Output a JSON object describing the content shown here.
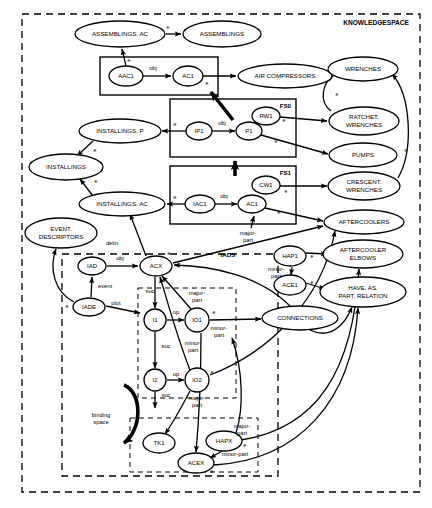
{
  "diagram": {
    "title": "KNOWLEDGESPACE",
    "type": "semantic-network-knowledge-representation",
    "stroke_color": "#000000",
    "background_color": "#ffffff",
    "outer_frame_label": "KNOWLEDGESPACE",
    "regions": [
      {
        "id": "knowledgespace",
        "label": "KNOWLEDGESPACE",
        "style": "dashed",
        "x": 22,
        "y": 14,
        "w": 398,
        "h": 478
      },
      {
        "id": "iads",
        "label": "IADS",
        "style": "dashed",
        "x": 62,
        "y": 254,
        "w": 216,
        "h": 222
      },
      {
        "id": "inner-iads-ops",
        "label": "",
        "style": "dashed",
        "x": 138,
        "y": 288,
        "w": 98,
        "h": 110
      },
      {
        "id": "inner-iads-objs",
        "label": "",
        "style": "dashed",
        "x": 130,
        "y": 418,
        "w": 128,
        "h": 54
      },
      {
        "id": "fs0",
        "label": "FS0",
        "style": "solid",
        "x": 100,
        "y": 57,
        "w": 118,
        "h": 38
      },
      {
        "id": "fs1",
        "label": "FS1",
        "style": "solid",
        "x": 170,
        "y": 99,
        "w": 126,
        "h": 58
      },
      {
        "id": "fs2",
        "label": "FS2",
        "style": "solid",
        "x": 170,
        "y": 166,
        "w": 126,
        "h": 58
      }
    ],
    "nodes": [
      {
        "id": "assemblings_ac",
        "label": "ASSEMBLINGS. AC",
        "shape": "ellipse",
        "cx": 120,
        "cy": 34,
        "rx": 45,
        "ry": 13,
        "font": 6.2
      },
      {
        "id": "assemblings",
        "label": "ASSEMBLINGS",
        "shape": "ellipse",
        "cx": 222,
        "cy": 34,
        "rx": 39,
        "ry": 13,
        "font": 6.2
      },
      {
        "id": "aac1",
        "label": "AAC1",
        "shape": "ellipse",
        "cx": 126,
        "cy": 76,
        "rx": 17,
        "ry": 10,
        "font": 6.0
      },
      {
        "id": "ac1_fs0",
        "label": "AC1",
        "shape": "ellipse",
        "cx": 188,
        "cy": 76,
        "rx": 15,
        "ry": 10,
        "font": 6.0
      },
      {
        "id": "air_compressors",
        "label": "AIR COMPRESSORS",
        "shape": "ellipse",
        "cx": 285,
        "cy": 76,
        "rx": 47,
        "ry": 12,
        "font": 6.2
      },
      {
        "id": "installings_p",
        "label": "INSTALLINGS. P",
        "shape": "ellipse",
        "cx": 120,
        "cy": 131,
        "rx": 41,
        "ry": 12,
        "font": 6.2
      },
      {
        "id": "ip1",
        "label": "IP1",
        "shape": "ellipse",
        "cx": 199,
        "cy": 131,
        "rx": 13,
        "ry": 9,
        "font": 6.0
      },
      {
        "id": "p1",
        "label": "P1",
        "shape": "ellipse",
        "cx": 249,
        "cy": 131,
        "rx": 13,
        "ry": 9,
        "font": 6.0
      },
      {
        "id": "rw1",
        "label": "RW1",
        "shape": "ellipse",
        "cx": 266,
        "cy": 116,
        "rx": 14,
        "ry": 9,
        "font": 6.0
      },
      {
        "id": "installings",
        "label": "INSTALLINGS",
        "shape": "ellipse",
        "cx": 66,
        "cy": 167,
        "rx": 37,
        "ry": 13,
        "font": 6.2
      },
      {
        "id": "installings_ac",
        "label": "INSTALLINGS. AC",
        "shape": "ellipse",
        "cx": 122,
        "cy": 204,
        "rx": 43,
        "ry": 12,
        "font": 6.2
      },
      {
        "id": "iac1",
        "label": "IAC1",
        "shape": "ellipse",
        "cx": 200,
        "cy": 204,
        "rx": 15,
        "ry": 9,
        "font": 6.0
      },
      {
        "id": "ac1_fs2",
        "label": "AC1",
        "shape": "ellipse",
        "cx": 252,
        "cy": 204,
        "rx": 14,
        "ry": 9,
        "font": 6.0
      },
      {
        "id": "cw1",
        "label": "CW1",
        "shape": "ellipse",
        "cx": 266,
        "cy": 185,
        "rx": 14,
        "ry": 9,
        "font": 6.0
      },
      {
        "id": "wrenches",
        "label": "WRENCHES",
        "shape": "ellipse",
        "cx": 363,
        "cy": 69,
        "rx": 35,
        "ry": 12,
        "font": 6.2
      },
      {
        "id": "ratchet_wrenches",
        "label": "RATCHET.\nWRENCHES",
        "shape": "ellipse",
        "cx": 364,
        "cy": 121,
        "rx": 35,
        "ry": 14,
        "font": 6.2
      },
      {
        "id": "pumps",
        "label": "PUMPS",
        "shape": "ellipse",
        "cx": 363,
        "cy": 155,
        "rx": 34,
        "ry": 12,
        "font": 6.2
      },
      {
        "id": "crescent_wrenches",
        "label": "CRESCENT.\nWRENCHES",
        "shape": "ellipse",
        "cx": 364,
        "cy": 186,
        "rx": 36,
        "ry": 14,
        "font": 6.2
      },
      {
        "id": "aftercoolers",
        "label": "AFTERCOOLERS",
        "shape": "ellipse",
        "cx": 364,
        "cy": 222,
        "rx": 40,
        "ry": 12,
        "font": 6.2
      },
      {
        "id": "aftercooler_elbows",
        "label": "AFTERCOOLER\nELBOWS",
        "shape": "ellipse",
        "cx": 363,
        "cy": 254,
        "rx": 40,
        "ry": 14,
        "font": 6.2
      },
      {
        "id": "have_as_part_relation",
        "label": "HAVE. AS.\nPART. RELATION",
        "shape": "ellipse",
        "cx": 363,
        "cy": 292,
        "rx": 43,
        "ry": 15,
        "font": 6.2
      },
      {
        "id": "event_descriptors",
        "label": "EVENT.\nDESCRIPTORS",
        "shape": "ellipse",
        "cx": 61,
        "cy": 233,
        "rx": 36,
        "ry": 15,
        "font": 6.2
      },
      {
        "id": "iad",
        "label": "IAD",
        "shape": "ellipse",
        "cx": 92,
        "cy": 266,
        "rx": 14,
        "ry": 9,
        "font": 6.0
      },
      {
        "id": "acx",
        "label": "ACX",
        "shape": "ellipse",
        "cx": 156,
        "cy": 266,
        "rx": 16,
        "ry": 10,
        "font": 6.0
      },
      {
        "id": "iade",
        "label": "IADE",
        "shape": "ellipse",
        "cx": 89,
        "cy": 307,
        "rx": 16,
        "ry": 9,
        "font": 6.0
      },
      {
        "id": "i1",
        "label": "I1",
        "shape": "circle",
        "cx": 155,
        "cy": 320,
        "rx": 11,
        "ry": 11,
        "font": 6.0
      },
      {
        "id": "io1",
        "label": "IO1",
        "shape": "circle",
        "cx": 197,
        "cy": 320,
        "rx": 12,
        "ry": 12,
        "font": 6.0
      },
      {
        "id": "i2",
        "label": "I2",
        "shape": "circle",
        "cx": 155,
        "cy": 380,
        "rx": 11,
        "ry": 11,
        "font": 6.0
      },
      {
        "id": "io2",
        "label": "IO2",
        "shape": "circle",
        "cx": 197,
        "cy": 380,
        "rx": 12,
        "ry": 12,
        "font": 6.0
      },
      {
        "id": "hap1",
        "label": "HAP1",
        "shape": "ellipse",
        "cx": 290,
        "cy": 256,
        "rx": 16,
        "ry": 10,
        "font": 6.0
      },
      {
        "id": "ace1",
        "label": "ACE1",
        "shape": "ellipse",
        "cx": 290,
        "cy": 285,
        "rx": 16,
        "ry": 10,
        "font": 6.0
      },
      {
        "id": "connections",
        "label": "CONNECTIONS",
        "shape": "ellipse",
        "cx": 300,
        "cy": 318,
        "rx": 38,
        "ry": 12,
        "font": 6.2
      },
      {
        "id": "tk1",
        "label": "TK1",
        "shape": "ellipse",
        "cx": 159,
        "cy": 443,
        "rx": 16,
        "ry": 10,
        "font": 6.0
      },
      {
        "id": "hapx",
        "label": "HAPX",
        "shape": "ellipse",
        "cx": 224,
        "cy": 441,
        "rx": 18,
        "ry": 10,
        "font": 6.0
      },
      {
        "id": "acex",
        "label": "ACEX",
        "shape": "ellipse",
        "cx": 196,
        "cy": 463,
        "rx": 18,
        "ry": 10,
        "font": 6.0
      }
    ],
    "edge_labels": [
      {
        "id": "e-assemblings-el",
        "text": "e",
        "x": 168,
        "y": 29
      },
      {
        "id": "e-aac1-assemblings-el",
        "text": "e",
        "x": 129,
        "y": 62
      },
      {
        "id": "obj-aac1-ac1",
        "text": "obj",
        "x": 153,
        "y": 70
      },
      {
        "id": "e-ac1-aircompressors",
        "text": "e",
        "x": 207,
        "y": 85
      },
      {
        "id": "e-ip1-installingsp",
        "text": "e",
        "x": 175,
        "y": 126
      },
      {
        "id": "obj-ip1-p1",
        "text": "obj",
        "x": 222,
        "y": 125
      },
      {
        "id": "e-rw1-ratchet",
        "text": "e",
        "x": 284,
        "y": 122
      },
      {
        "id": "e-p1-pumps",
        "text": "e",
        "x": 276,
        "y": 143
      },
      {
        "id": "e-installingsp-installings",
        "text": "e",
        "x": 95,
        "y": 152
      },
      {
        "id": "e-installingsac-installings",
        "text": "e",
        "x": 96,
        "y": 183
      },
      {
        "id": "e-iac1-installingsac",
        "text": "e",
        "x": 175,
        "y": 199
      },
      {
        "id": "obj-iac1-ac1",
        "text": "obj",
        "x": 224,
        "y": 198
      },
      {
        "id": "e-cw1-crescent",
        "text": "e",
        "x": 286,
        "y": 193
      },
      {
        "id": "e-ac1-aftercoolers",
        "text": "e",
        "x": 279,
        "y": 214
      },
      {
        "id": "e-wrenches-ratchet",
        "text": "e",
        "x": 337,
        "y": 96
      },
      {
        "id": "e-wrenches-crescent",
        "text": "e",
        "x": 406,
        "y": 152
      },
      {
        "id": "delin",
        "text": "delin",
        "x": 112,
        "y": 245
      },
      {
        "id": "obj-iad-acx",
        "text": "obj",
        "x": 120,
        "y": 260
      },
      {
        "id": "e-acx-top",
        "text": "e",
        "x": 169,
        "y": 255
      },
      {
        "id": "event",
        "text": "event",
        "x": 105,
        "y": 288
      },
      {
        "id": "plot",
        "text": "plot",
        "x": 116,
        "y": 305
      },
      {
        "id": "e-iade",
        "text": "e",
        "x": 67,
        "y": 308
      },
      {
        "id": "iads-label",
        "text": "IADS",
        "x": 228,
        "y": 257
      },
      {
        "id": "majorpart-ac1",
        "text": "major-\npart",
        "x": 248,
        "y": 235
      },
      {
        "id": "minorpart-hap1",
        "text": "minor-\npart",
        "x": 276,
        "y": 271
      },
      {
        "id": "e-hap1",
        "text": "e",
        "x": 312,
        "y": 258
      },
      {
        "id": "e-ace1",
        "text": "e",
        "x": 312,
        "y": 284
      },
      {
        "id": "suc-acx-i1",
        "text": "suc",
        "x": 150,
        "y": 293
      },
      {
        "id": "majorpart-io1",
        "text": "major-\npart",
        "x": 197,
        "y": 295
      },
      {
        "id": "op-i1-io1",
        "text": "op",
        "x": 176,
        "y": 314
      },
      {
        "id": "e-io1-connections",
        "text": "e",
        "x": 214,
        "y": 314
      },
      {
        "id": "minorpart-io1",
        "text": "minor-\npart",
        "x": 219,
        "y": 330
      },
      {
        "id": "suc-i1-i2",
        "text": "suc",
        "x": 166,
        "y": 348
      },
      {
        "id": "minorpart-mid",
        "text": "minor-\npart",
        "x": 193,
        "y": 345
      },
      {
        "id": "op-i2-io2",
        "text": "op",
        "x": 176,
        "y": 376
      },
      {
        "id": "e-io2",
        "text": "e",
        "x": 212,
        "y": 374
      },
      {
        "id": "suc-i2-down",
        "text": "suc",
        "x": 166,
        "y": 397
      },
      {
        "id": "majorpart-io2",
        "text": "major-\npart",
        "x": 197,
        "y": 400
      },
      {
        "id": "binding-space",
        "text": "binding\nspace",
        "x": 101,
        "y": 417
      },
      {
        "id": "majorpart-hapx",
        "text": "major-\npart",
        "x": 242,
        "y": 428
      },
      {
        "id": "e-hapx",
        "text": "e",
        "x": 245,
        "y": 447
      },
      {
        "id": "minorpart-acex",
        "text": "minor-part",
        "x": 235,
        "y": 456
      },
      {
        "id": "e-acex",
        "text": "e",
        "x": 212,
        "y": 473
      }
    ]
  }
}
